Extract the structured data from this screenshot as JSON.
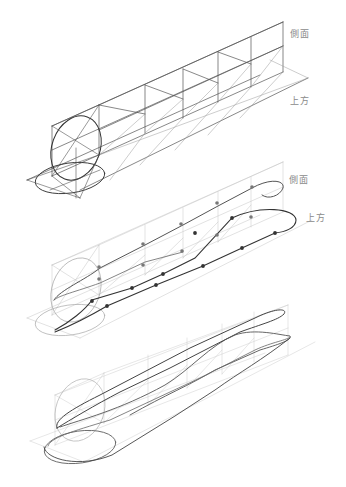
{
  "panels": [
    {
      "id": "panel-1",
      "stage": "box-framework",
      "labels": {
        "side": "側面",
        "top": "上方"
      },
      "segments": 5
    },
    {
      "id": "panel-2",
      "stage": "contour-with-points",
      "labels": {
        "side": "側面",
        "top": "上方"
      },
      "segments": 5
    },
    {
      "id": "panel-3",
      "stage": "final-form",
      "segments": 5
    }
  ],
  "colors": {
    "background": "#ffffff",
    "frame_dark": "#555555",
    "frame_light": "#bdbdbd",
    "contour": "#444444",
    "point_dark": "#333333",
    "point_light": "#777777",
    "label": "#8a8a8a"
  }
}
